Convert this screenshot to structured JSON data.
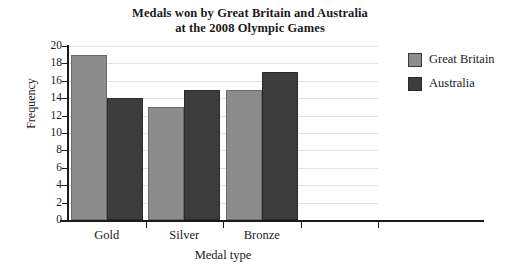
{
  "chart_data": {
    "type": "bar",
    "title": "Medals won by Great Britain and Australia at the 2008 Olympic Games",
    "title_lines": [
      "Medals won by Great Britain and Australia",
      "at the 2008 Olympic Games"
    ],
    "categories": [
      "Gold",
      "Silver",
      "Bronze"
    ],
    "series": [
      {
        "name": "Great Britain",
        "color": "#8c8c8c",
        "values": [
          19,
          13,
          15
        ]
      },
      {
        "name": "Australia",
        "color": "#3c3c3c",
        "values": [
          14,
          15,
          17
        ]
      }
    ],
    "xlabel": "Medal type",
    "ylabel": "Frequency",
    "ylim": [
      0,
      20
    ],
    "ytick_step": 2,
    "yticks": [
      0,
      2,
      4,
      6,
      8,
      10,
      12,
      14,
      16,
      18,
      20
    ],
    "grid": true,
    "legend_position": "right"
  }
}
